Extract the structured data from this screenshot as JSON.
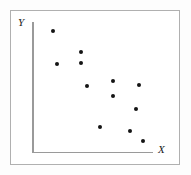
{
  "figure": {
    "background_color": "#fdfdfd",
    "frame_color": "#b0b0b0",
    "axis_color": "#9a9a9a",
    "point_color": "#141414"
  },
  "chart_data": {
    "type": "scatter",
    "title": "",
    "xlabel": "X",
    "ylabel": "Y",
    "grid": false,
    "legend": null,
    "xlim": [
      0,
      10
    ],
    "ylim": [
      0,
      10
    ],
    "tick_labels": {
      "x": [],
      "y": []
    },
    "series": [
      {
        "name": "observations",
        "marker": "circle",
        "color": "#141414",
        "points": [
          {
            "x": 1.74,
            "y": 9.31
          },
          {
            "x": 4.05,
            "y": 7.69
          },
          {
            "x": 2.07,
            "y": 6.77
          },
          {
            "x": 4.05,
            "y": 6.85
          },
          {
            "x": 4.55,
            "y": 5.08
          },
          {
            "x": 6.69,
            "y": 5.46
          },
          {
            "x": 8.84,
            "y": 5.15
          },
          {
            "x": 6.69,
            "y": 4.31
          },
          {
            "x": 8.6,
            "y": 3.31
          },
          {
            "x": 5.62,
            "y": 1.92
          },
          {
            "x": 8.1,
            "y": 1.62
          },
          {
            "x": 9.17,
            "y": 0.85
          }
        ]
      }
    ]
  },
  "labels": {
    "y_axis": "Y",
    "x_axis": "X"
  }
}
